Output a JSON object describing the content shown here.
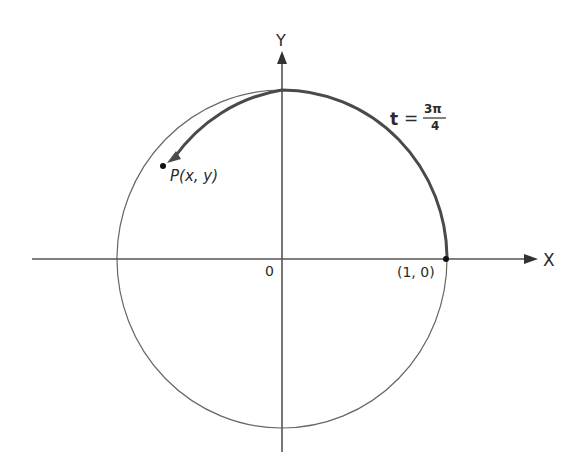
{
  "diagram": {
    "type": "unit-circle",
    "axes": {
      "x_label": "X",
      "y_label": "Y",
      "origin_label": "0"
    },
    "points": {
      "start": {
        "label": "(1, 0)"
      },
      "terminal": {
        "label_prefix": "P",
        "label_args": "(x, y)"
      }
    },
    "arc": {
      "t_label": "t",
      "equals": "=",
      "numerator": "3π",
      "denominator": "4"
    },
    "colors": {
      "stroke": "#555555",
      "thick_arc": "#4a4a4a",
      "point": "#111111"
    }
  }
}
